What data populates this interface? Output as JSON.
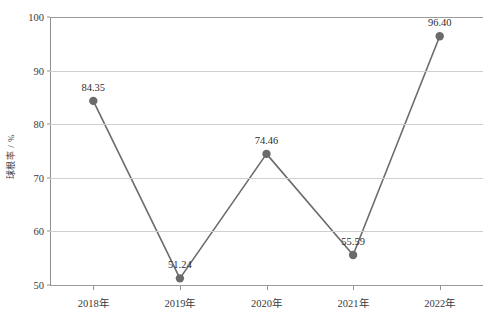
{
  "chart_data": {
    "type": "line",
    "title": "",
    "subtitle": "",
    "xlabel": "",
    "ylabel": "球根率 / %",
    "categories": [
      "2018年",
      "2019年",
      "2020年",
      "2021年",
      "2022年"
    ],
    "series": [
      {
        "name": "球根率",
        "values": [
          84.35,
          51.24,
          74.46,
          55.59,
          96.4
        ],
        "point_labels": [
          "84.35",
          "51.24",
          "74.46",
          "55.59",
          "96.40"
        ],
        "color": "#6b6b6b",
        "marker": "circle",
        "marker_color": "#6b6b6b"
      }
    ],
    "ylim": [
      50,
      100
    ],
    "yticks": [
      50,
      60,
      70,
      80,
      90,
      100
    ],
    "ytick_labels": [
      "50",
      "60",
      "70",
      "80",
      "90",
      "100"
    ],
    "grid": true,
    "grid_axis": "y",
    "grid_color": "#cfcfcf",
    "legend": false,
    "legend_position": "none",
    "background": "#ffffff",
    "axis_color": "#8f8f8f"
  },
  "figure": {
    "width": 494,
    "height": 312
  }
}
